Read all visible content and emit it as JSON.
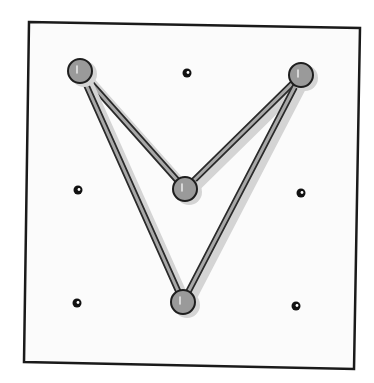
{
  "diagram": {
    "type": "geoboard",
    "grid": {
      "rows": 3,
      "cols": 3
    },
    "pegs": [
      {
        "id": "peg-0-0",
        "row": 0,
        "col": 0,
        "used": true
      },
      {
        "id": "peg-0-1",
        "row": 0,
        "col": 1,
        "used": false
      },
      {
        "id": "peg-0-2",
        "row": 0,
        "col": 2,
        "used": true
      },
      {
        "id": "peg-1-0",
        "row": 1,
        "col": 0,
        "used": false
      },
      {
        "id": "peg-1-1",
        "row": 1,
        "col": 1,
        "used": true
      },
      {
        "id": "peg-1-2",
        "row": 1,
        "col": 2,
        "used": false
      },
      {
        "id": "peg-2-0",
        "row": 2,
        "col": 0,
        "used": false
      },
      {
        "id": "peg-2-1",
        "row": 2,
        "col": 1,
        "used": true
      },
      {
        "id": "peg-2-2",
        "row": 2,
        "col": 2,
        "used": false
      }
    ],
    "band_path": [
      "peg-0-0",
      "peg-1-1",
      "peg-0-2",
      "peg-2-1"
    ],
    "shape": "concave quadrilateral (arrowhead)",
    "colors": {
      "frame": "#1a1a1a",
      "board": "#fbfbfb",
      "peg_used_fill": "#9a9a9a",
      "peg_outline": "#1e1e1e",
      "band_fill": "#a8a8a8",
      "band_edge": "#2a2a2a",
      "shadow": "#d4d4d4"
    }
  }
}
